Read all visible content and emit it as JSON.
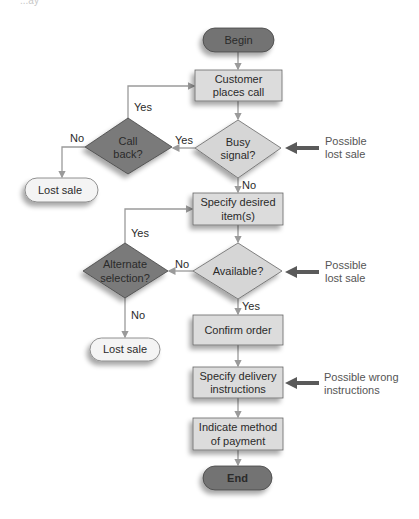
{
  "header_fragment": "...ay",
  "colors": {
    "terminal_fill": "#737373",
    "decision_fill_dark": "#7a7a7a",
    "process_fill": "#dcdcdc",
    "decision_fill_light": "#d6d6d6",
    "lost_sale_fill": "#f4f4f4",
    "connector": "#9a9a9a",
    "callout_arrow": "#5a5a5a",
    "text": "#2a2a2a",
    "annotation_text": "#555555"
  },
  "nodes": {
    "begin": {
      "type": "terminal",
      "label": "Begin"
    },
    "customer_call": {
      "type": "process",
      "line1": "Customer",
      "line2": "places call"
    },
    "busy_signal": {
      "type": "decision",
      "line1": "Busy",
      "line2": "signal?"
    },
    "call_back": {
      "type": "decision",
      "line1": "Call",
      "line2": "back?"
    },
    "lost_sale_1": {
      "type": "terminal-light",
      "label": "Lost sale"
    },
    "specify_items": {
      "type": "process",
      "line1": "Specify desired",
      "line2": "item(s)"
    },
    "available": {
      "type": "decision",
      "label": "Available?"
    },
    "alternate": {
      "type": "decision",
      "line1": "Alternate",
      "line2": "selection?"
    },
    "lost_sale_2": {
      "type": "terminal-light",
      "label": "Lost sale"
    },
    "confirm": {
      "type": "process",
      "label": "Confirm order"
    },
    "delivery": {
      "type": "process",
      "line1": "Specify delivery",
      "line2": "instructions"
    },
    "payment": {
      "type": "process",
      "line1": "Indicate method",
      "line2": "of payment"
    },
    "end": {
      "type": "terminal",
      "label": "End"
    }
  },
  "edge_labels": {
    "callback_yes": "Yes",
    "busy_yes": "Yes",
    "callback_no": "No",
    "busy_no": "No",
    "alternate_yes": "Yes",
    "available_no": "No",
    "alternate_no": "No",
    "available_yes": "Yes"
  },
  "annotations": {
    "busy": {
      "line1": "Possible",
      "line2": "lost sale"
    },
    "available": {
      "line1": "Possible",
      "line2": "lost sale"
    },
    "delivery": {
      "line1": "Possible wrong",
      "line2": "instructions"
    }
  }
}
